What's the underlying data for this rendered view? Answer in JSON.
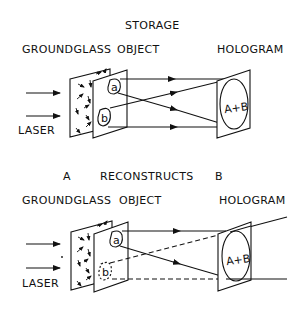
{
  "storage": {
    "title": "STORAGE",
    "labels": {
      "groundglass": "GROUNDGLASS",
      "object": "OBJECT",
      "hologram": "HOLOGRAM",
      "laser": "LASER"
    },
    "object_points": {
      "a": "a",
      "b": "b"
    },
    "hologram_text": "A+B"
  },
  "reconstruct": {
    "title_left": "A",
    "title_mid": "RECONSTRUCTS",
    "title_right": "B",
    "labels": {
      "groundglass": "GROUNDGLASS",
      "object": "OBJECT",
      "hologram": "HOLOGRAM",
      "laser": "LASER"
    },
    "object_points": {
      "a": "a",
      "b": "b"
    },
    "hologram_text": "A+B"
  }
}
